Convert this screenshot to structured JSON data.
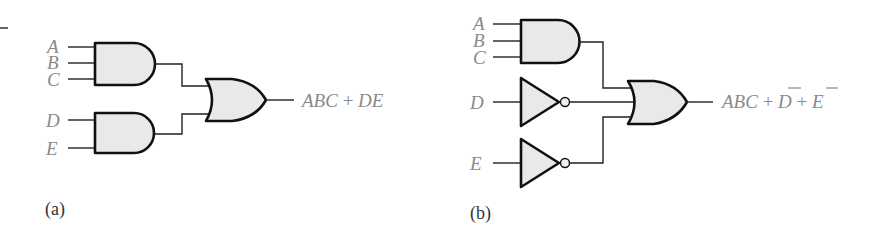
{
  "colors": {
    "gate_fill": "#e9e9e9",
    "gate_stroke": "#111111",
    "label_text": "#8a8a8a",
    "caption_text": "#333333"
  },
  "diagram_a": {
    "caption": "(a)",
    "inputs": [
      "A",
      "B",
      "C",
      "D",
      "E"
    ],
    "gates": [
      {
        "type": "AND",
        "inputs": [
          "A",
          "B",
          "C"
        ],
        "output": "ABC"
      },
      {
        "type": "AND",
        "inputs": [
          "D",
          "E"
        ],
        "output": "DE"
      },
      {
        "type": "OR",
        "inputs": [
          "ABC",
          "DE"
        ],
        "output": "ABC + DE"
      }
    ],
    "output_expression": {
      "part1": "ABC",
      "plus1": " + ",
      "part2": "DE"
    }
  },
  "diagram_b": {
    "caption": "(b)",
    "inputs": [
      "A",
      "B",
      "C",
      "D",
      "E"
    ],
    "gates": [
      {
        "type": "AND",
        "inputs": [
          "A",
          "B",
          "C"
        ],
        "output": "ABC"
      },
      {
        "type": "NOT",
        "inputs": [
          "D"
        ],
        "output": "D̄"
      },
      {
        "type": "NOT",
        "inputs": [
          "E"
        ],
        "output": "Ē"
      },
      {
        "type": "OR",
        "inputs": [
          "ABC",
          "D̄",
          "Ē"
        ],
        "output": "ABC + D̄ + Ē"
      }
    ],
    "output_expression": {
      "part1": "ABC",
      "plus1": " + ",
      "part2": "D",
      "plus2": " + ",
      "part3": "E"
    }
  }
}
